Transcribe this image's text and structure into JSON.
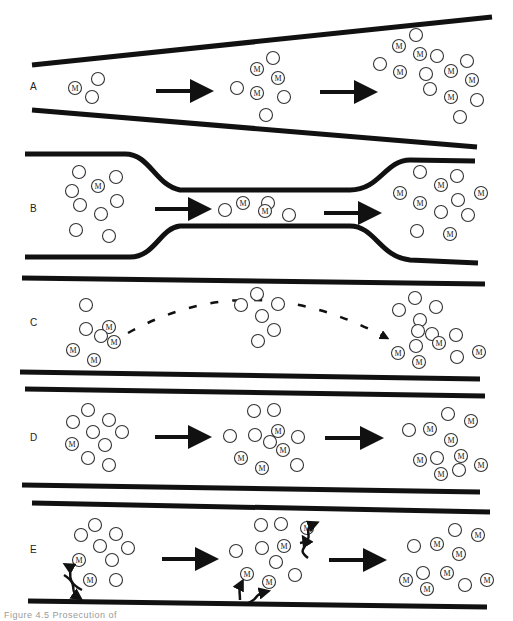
{
  "figure": {
    "caption": "Figure 4.5 Prosecution of",
    "marker_label": "M",
    "colors": {
      "wall": "#111111",
      "particle_stroke": "#333333",
      "background": "#ffffff"
    },
    "panels": [
      {
        "id": "A",
        "label": "A",
        "label_pos": [
          30,
          90
        ],
        "walls": [
          "M 32 65 L 492 17",
          "M 32 110 L 477 147"
        ],
        "arrows": [
          {
            "x1": 156,
            "y1": 91,
            "x2": 212,
            "y2": 91
          },
          {
            "x1": 320,
            "y1": 92,
            "x2": 376,
            "y2": 92
          }
        ],
        "particles": [
          {
            "x": 75,
            "y": 88,
            "m": true
          },
          {
            "x": 98,
            "y": 79,
            "m": false
          },
          {
            "x": 92,
            "y": 97,
            "m": false
          },
          {
            "x": 237,
            "y": 88,
            "m": false
          },
          {
            "x": 257,
            "y": 69,
            "m": true
          },
          {
            "x": 273,
            "y": 58,
            "m": false
          },
          {
            "x": 278,
            "y": 78,
            "m": true
          },
          {
            "x": 257,
            "y": 93,
            "m": true
          },
          {
            "x": 284,
            "y": 97,
            "m": false
          },
          {
            "x": 266,
            "y": 115,
            "m": false
          },
          {
            "x": 380,
            "y": 64,
            "m": false
          },
          {
            "x": 399,
            "y": 46,
            "m": true
          },
          {
            "x": 416,
            "y": 35,
            "m": false
          },
          {
            "x": 420,
            "y": 54,
            "m": true
          },
          {
            "x": 437,
            "y": 56,
            "m": false
          },
          {
            "x": 400,
            "y": 72,
            "m": true
          },
          {
            "x": 426,
            "y": 74,
            "m": false
          },
          {
            "x": 430,
            "y": 89,
            "m": false
          },
          {
            "x": 451,
            "y": 71,
            "m": true
          },
          {
            "x": 467,
            "y": 61,
            "m": false
          },
          {
            "x": 472,
            "y": 80,
            "m": true
          },
          {
            "x": 451,
            "y": 97,
            "m": true
          },
          {
            "x": 477,
            "y": 100,
            "m": false
          },
          {
            "x": 460,
            "y": 117,
            "m": false
          }
        ]
      },
      {
        "id": "B",
        "label": "B",
        "label_pos": [
          30,
          212
        ],
        "walls": [
          "M 25 154 L 125 154 C 150 154, 155 185, 180 190 L 350 190 C 380 190, 385 160, 410 160 L 475 161",
          "M 25 257 L 130 257 C 155 257, 160 228, 180 226 L 350 226 C 375 226, 380 257, 410 260 L 478 263"
        ],
        "arrows": [
          {
            "x1": 155,
            "y1": 209,
            "x2": 210,
            "y2": 209
          },
          {
            "x1": 324,
            "y1": 213,
            "x2": 380,
            "y2": 213
          }
        ],
        "particles": [
          {
            "x": 79,
            "y": 172,
            "m": false
          },
          {
            "x": 98,
            "y": 186,
            "m": true
          },
          {
            "x": 116,
            "y": 177,
            "m": false
          },
          {
            "x": 72,
            "y": 191,
            "m": false
          },
          {
            "x": 80,
            "y": 205,
            "m": false
          },
          {
            "x": 117,
            "y": 201,
            "m": false
          },
          {
            "x": 101,
            "y": 214,
            "m": false
          },
          {
            "x": 76,
            "y": 230,
            "m": false
          },
          {
            "x": 109,
            "y": 236,
            "m": false
          },
          {
            "x": 225,
            "y": 210,
            "m": false
          },
          {
            "x": 243,
            "y": 203,
            "m": true
          },
          {
            "x": 268,
            "y": 203,
            "m": false
          },
          {
            "x": 265,
            "y": 211,
            "m": true
          },
          {
            "x": 289,
            "y": 215,
            "m": false
          },
          {
            "x": 400,
            "y": 193,
            "m": true
          },
          {
            "x": 420,
            "y": 172,
            "m": false
          },
          {
            "x": 441,
            "y": 185,
            "m": true
          },
          {
            "x": 457,
            "y": 176,
            "m": false
          },
          {
            "x": 420,
            "y": 203,
            "m": true
          },
          {
            "x": 458,
            "y": 200,
            "m": false
          },
          {
            "x": 441,
            "y": 212,
            "m": false
          },
          {
            "x": 468,
            "y": 215,
            "m": false
          },
          {
            "x": 481,
            "y": 193,
            "m": true
          },
          {
            "x": 417,
            "y": 231,
            "m": false
          },
          {
            "x": 450,
            "y": 234,
            "m": true
          }
        ]
      },
      {
        "id": "C",
        "label": "C",
        "label_pos": [
          30,
          326
        ],
        "walls": [
          "M 22 278 L 485 284",
          "M 20 372 L 480 379"
        ],
        "dashed_path": "M 128 333 Q 250 265 385 337",
        "particles": [
          {
            "x": 86,
            "y": 305,
            "m": false
          },
          {
            "x": 86,
            "y": 329,
            "m": false
          },
          {
            "x": 109,
            "y": 327,
            "m": true
          },
          {
            "x": 101,
            "y": 336,
            "m": false
          },
          {
            "x": 114,
            "y": 342,
            "m": true
          },
          {
            "x": 73,
            "y": 350,
            "m": true
          },
          {
            "x": 94,
            "y": 360,
            "m": true
          },
          {
            "x": 241,
            "y": 305,
            "m": false
          },
          {
            "x": 257,
            "y": 294,
            "m": false
          },
          {
            "x": 278,
            "y": 304,
            "m": false
          },
          {
            "x": 262,
            "y": 316,
            "m": false
          },
          {
            "x": 274,
            "y": 330,
            "m": false
          },
          {
            "x": 258,
            "y": 341,
            "m": false
          },
          {
            "x": 399,
            "y": 310,
            "m": false
          },
          {
            "x": 415,
            "y": 298,
            "m": false
          },
          {
            "x": 436,
            "y": 307,
            "m": false
          },
          {
            "x": 420,
            "y": 320,
            "m": false
          },
          {
            "x": 418,
            "y": 331,
            "m": false
          },
          {
            "x": 432,
            "y": 334,
            "m": false
          },
          {
            "x": 456,
            "y": 335,
            "m": false
          },
          {
            "x": 439,
            "y": 343,
            "m": true
          },
          {
            "x": 416,
            "y": 346,
            "m": false
          },
          {
            "x": 398,
            "y": 353,
            "m": true
          },
          {
            "x": 419,
            "y": 362,
            "m": true
          },
          {
            "x": 457,
            "y": 357,
            "m": false
          },
          {
            "x": 479,
            "y": 352,
            "m": true
          }
        ]
      },
      {
        "id": "D",
        "label": "D",
        "label_pos": [
          30,
          441
        ],
        "walls": [
          "M 25 389 L 485 396",
          "M 22 485 L 480 492"
        ],
        "arrows": [
          {
            "x1": 155,
            "y1": 437,
            "x2": 210,
            "y2": 437
          },
          {
            "x1": 325,
            "y1": 438,
            "x2": 382,
            "y2": 438
          }
        ],
        "particles": [
          {
            "x": 88,
            "y": 410,
            "m": false
          },
          {
            "x": 73,
            "y": 422,
            "m": false
          },
          {
            "x": 109,
            "y": 420,
            "m": false
          },
          {
            "x": 93,
            "y": 432,
            "m": false
          },
          {
            "x": 122,
            "y": 432,
            "m": false
          },
          {
            "x": 72,
            "y": 444,
            "m": true
          },
          {
            "x": 105,
            "y": 445,
            "m": false
          },
          {
            "x": 88,
            "y": 458,
            "m": false
          },
          {
            "x": 109,
            "y": 465,
            "m": false
          },
          {
            "x": 230,
            "y": 436,
            "m": false
          },
          {
            "x": 254,
            "y": 411,
            "m": false
          },
          {
            "x": 274,
            "y": 410,
            "m": false
          },
          {
            "x": 255,
            "y": 435,
            "m": false
          },
          {
            "x": 278,
            "y": 431,
            "m": true
          },
          {
            "x": 270,
            "y": 442,
            "m": false
          },
          {
            "x": 283,
            "y": 450,
            "m": true
          },
          {
            "x": 298,
            "y": 437,
            "m": false
          },
          {
            "x": 241,
            "y": 458,
            "m": true
          },
          {
            "x": 262,
            "y": 468,
            "m": true
          },
          {
            "x": 297,
            "y": 465,
            "m": false
          },
          {
            "x": 409,
            "y": 430,
            "m": false
          },
          {
            "x": 430,
            "y": 429,
            "m": true
          },
          {
            "x": 448,
            "y": 414,
            "m": false
          },
          {
            "x": 471,
            "y": 421,
            "m": true
          },
          {
            "x": 451,
            "y": 440,
            "m": true
          },
          {
            "x": 420,
            "y": 460,
            "m": true
          },
          {
            "x": 437,
            "y": 458,
            "m": false
          },
          {
            "x": 441,
            "y": 474,
            "m": true
          },
          {
            "x": 461,
            "y": 456,
            "m": true
          },
          {
            "x": 459,
            "y": 470,
            "m": false
          },
          {
            "x": 481,
            "y": 465,
            "m": true
          }
        ]
      },
      {
        "id": "E",
        "label": "E",
        "label_pos": [
          30,
          553
        ],
        "walls": [
          "M 32 503 L 490 512",
          "M 28 601 L 487 607"
        ],
        "arrows": [
          {
            "x1": 162,
            "y1": 559,
            "x2": 217,
            "y2": 559
          },
          {
            "x1": 329,
            "y1": 560,
            "x2": 385,
            "y2": 560
          }
        ],
        "particles": [
          {
            "x": 95,
            "y": 525,
            "m": false
          },
          {
            "x": 81,
            "y": 535,
            "m": false
          },
          {
            "x": 116,
            "y": 534,
            "m": false
          },
          {
            "x": 100,
            "y": 546,
            "m": false
          },
          {
            "x": 128,
            "y": 548,
            "m": false
          },
          {
            "x": 79,
            "y": 560,
            "m": true
          },
          {
            "x": 112,
            "y": 560,
            "m": false
          },
          {
            "x": 90,
            "y": 580,
            "m": true
          },
          {
            "x": 116,
            "y": 580,
            "m": false
          },
          {
            "x": 236,
            "y": 551,
            "m": false
          },
          {
            "x": 261,
            "y": 525,
            "m": false
          },
          {
            "x": 281,
            "y": 524,
            "m": false
          },
          {
            "x": 262,
            "y": 548,
            "m": false
          },
          {
            "x": 284,
            "y": 546,
            "m": true
          },
          {
            "x": 276,
            "y": 562,
            "m": false
          },
          {
            "x": 295,
            "y": 575,
            "m": false
          },
          {
            "x": 307,
            "y": 528,
            "m": true
          },
          {
            "x": 247,
            "y": 574,
            "m": true
          },
          {
            "x": 269,
            "y": 582,
            "m": true
          },
          {
            "x": 414,
            "y": 546,
            "m": false
          },
          {
            "x": 437,
            "y": 544,
            "m": true
          },
          {
            "x": 455,
            "y": 530,
            "m": false
          },
          {
            "x": 478,
            "y": 535,
            "m": true
          },
          {
            "x": 459,
            "y": 554,
            "m": true
          },
          {
            "x": 406,
            "y": 580,
            "m": true
          },
          {
            "x": 423,
            "y": 573,
            "m": false
          },
          {
            "x": 447,
            "y": 573,
            "m": true
          },
          {
            "x": 427,
            "y": 589,
            "m": true
          },
          {
            "x": 465,
            "y": 585,
            "m": false
          },
          {
            "x": 487,
            "y": 580,
            "m": true
          }
        ],
        "curved_arrows": [
          "M 82 590 C 62 580, 75 570, 68 566",
          "M 64 575 C 80 585, 68 590, 78 597",
          "M 300 543 C 318 540, 300 530, 314 524",
          "M 308 558 C 295 548, 310 548, 305 540",
          "M 240 600 C 240 590, 238 590, 241 584",
          "M 245 604 C 260 600, 252 595, 265 592"
        ]
      }
    ]
  }
}
